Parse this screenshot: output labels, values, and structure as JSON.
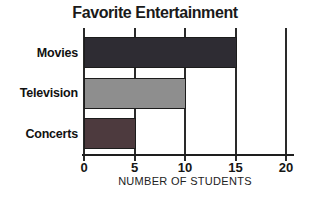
{
  "chart_data": {
    "type": "bar",
    "orientation": "horizontal",
    "title": "Favorite Entertainment",
    "categories": [
      "Movies",
      "Television",
      "Concerts"
    ],
    "values": [
      15,
      10,
      5
    ],
    "xlabel": "NUMBER OF STUDENTS",
    "xlim": [
      0,
      20
    ],
    "xticks": [
      0,
      5,
      10,
      15,
      20
    ],
    "grid": true,
    "legend": "none",
    "colors": {
      "bars": [
        "#2e2c33",
        "#8e8e8e",
        "#4d3a3e"
      ],
      "axis": "#1e1e1e",
      "gridline": "#2a2a2a",
      "title_text": "#1a1a1a",
      "background": "#ffffff"
    }
  }
}
